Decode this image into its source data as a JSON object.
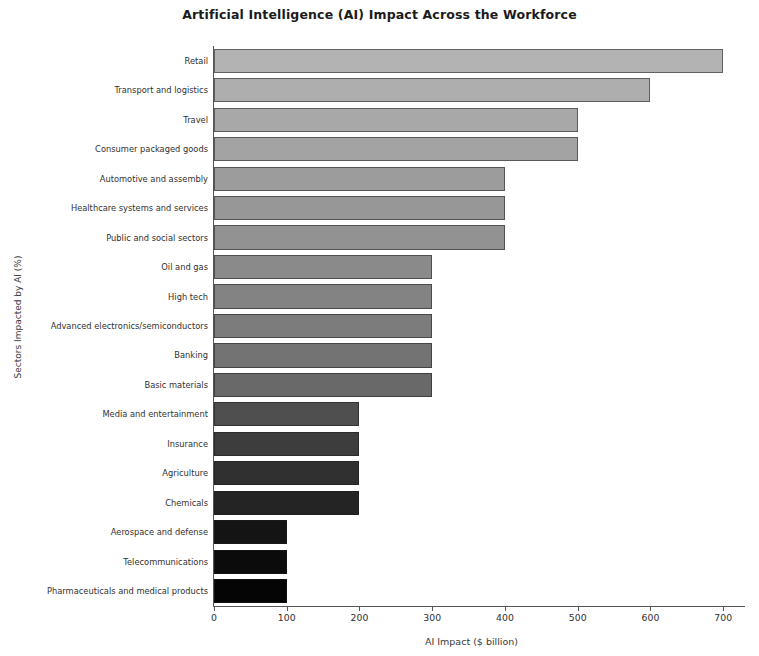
{
  "chart_data": {
    "type": "bar",
    "orientation": "horizontal",
    "title": "Artificial Intelligence (AI) Impact Across the Workforce",
    "xlabel": "AI Impact ($ billion)",
    "ylabel": "Sectors Impacted by AI (%)",
    "xlim": [
      0,
      730
    ],
    "ylim": [
      0,
      19
    ],
    "grid": false,
    "legend": null,
    "xticks": [
      0,
      100,
      200,
      300,
      400,
      500,
      600,
      700
    ],
    "xtick_labels": [
      "0",
      "100",
      "200",
      "300",
      "400",
      "500",
      "600",
      "700"
    ],
    "categories": [
      "Retail",
      "Transport and logistics",
      "Travel",
      "Consumer packaged goods",
      "Automotive and assembly",
      "Healthcare systems and services",
      "Public and social sectors",
      "Oil and gas",
      "High tech",
      "Advanced electronics/semiconductors",
      "Banking",
      "Basic materials",
      "Media and entertainment",
      "Insurance",
      "Agriculture",
      "Chemicals",
      "Aerospace and defense",
      "Telecommunications",
      "Pharmaceuticals and medical products"
    ],
    "values": [
      700,
      600,
      500,
      500,
      400,
      400,
      400,
      300,
      300,
      300,
      300,
      300,
      200,
      200,
      200,
      200,
      100,
      100,
      100
    ],
    "bar_colors": [
      "#b3b3b3",
      "#aeaeae",
      "#a8a8a8",
      "#a3a3a3",
      "#9c9c9c",
      "#979797",
      "#929292",
      "#8a8a8a",
      "#838383",
      "#7c7c7c",
      "#737373",
      "#696969",
      "#4f4f4f",
      "#3d3d3d",
      "#303030",
      "#242424",
      "#141414",
      "#0b0b0b",
      "#050505"
    ]
  }
}
